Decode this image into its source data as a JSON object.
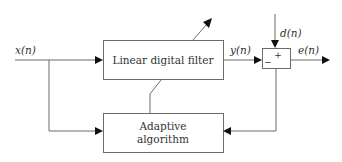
{
  "diagram": {
    "type": "block-diagram",
    "blocks": {
      "filter": {
        "label": "Linear digital filter"
      },
      "adaptive": {
        "line1": "Adaptive",
        "line2": "algorithm"
      },
      "summer": {
        "plus": "+",
        "minus": "−"
      }
    },
    "signals": {
      "input": "x(n)",
      "output": "y(n)",
      "desired": "d(n)",
      "error": "e(n)"
    },
    "colors": {
      "stroke": "#6b6b6b",
      "arrow": "#111111",
      "text": "#333333"
    }
  }
}
